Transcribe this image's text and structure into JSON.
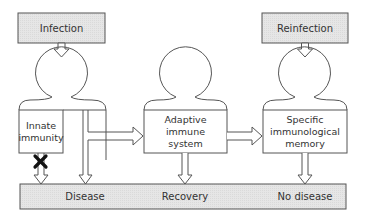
{
  "diagram": {
    "title_boxes": {
      "infection": "Infection",
      "reinfection": "Reinfection"
    },
    "stages": {
      "innate": [
        "Innate",
        "immunity"
      ],
      "adaptive": [
        "Adaptive",
        "immune",
        "system"
      ],
      "memory": [
        "Specific",
        "immunological",
        "memory"
      ]
    },
    "outcomes": {
      "disease": "Disease",
      "recovery": "Recovery",
      "no_disease": "No disease"
    },
    "blocked_marker": "x-mark-icon",
    "colors": {
      "box_fill": "#e4e4e4",
      "stroke": "#555555",
      "text": "#333333",
      "x_mark": "#111111"
    }
  }
}
